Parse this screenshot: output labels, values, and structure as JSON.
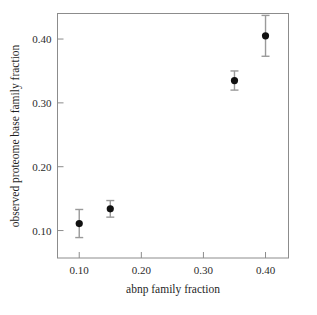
{
  "chart_data": {
    "type": "scatter",
    "title": "",
    "xlabel": "abnp family fraction",
    "ylabel": "observed proteome base family fraction",
    "xlim": [
      0.065,
      0.437
    ],
    "ylim": [
      0.057,
      0.44
    ],
    "xticks": [
      "0.10",
      "0.20",
      "0.30",
      "0.40"
    ],
    "xtick_values": [
      0.1,
      0.2,
      0.3,
      0.4
    ],
    "yticks": [
      "0.10",
      "0.20",
      "0.30",
      "0.40"
    ],
    "ytick_values": [
      0.1,
      0.2,
      0.3,
      0.4
    ],
    "grid": false,
    "legend": "none",
    "x": [
      0.1,
      0.15,
      0.35,
      0.4
    ],
    "y": [
      0.111,
      0.134,
      0.335,
      0.405
    ],
    "yerr": [
      0.022,
      0.013,
      0.015,
      0.032
    ],
    "points": [
      {
        "x": 0.1,
        "y": 0.111,
        "yerr": 0.022
      },
      {
        "x": 0.15,
        "y": 0.134,
        "yerr": 0.013
      },
      {
        "x": 0.35,
        "y": 0.335,
        "yerr": 0.015
      },
      {
        "x": 0.4,
        "y": 0.405,
        "yerr": 0.032
      }
    ],
    "marker": "filled-circle",
    "marker_color": "#111111",
    "errorbar_color": "#9a9a9a",
    "frame_color": "#8c8c8c",
    "background_color": "#ffffff"
  }
}
